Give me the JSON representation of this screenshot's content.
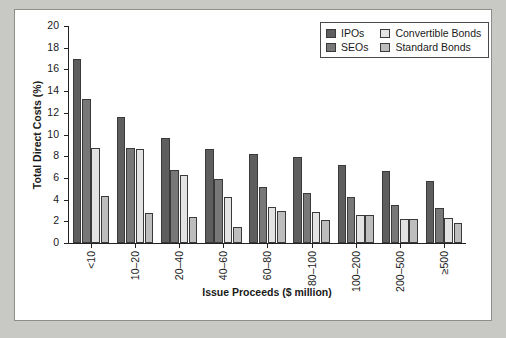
{
  "chart_data": {
    "type": "bar",
    "title": "",
    "xlabel": "Issue Proceeds ($ million)",
    "ylabel": "Total Direct Costs (%)",
    "ylim": [
      0,
      20
    ],
    "yticks": [
      0,
      2,
      4,
      6,
      8,
      10,
      12,
      14,
      16,
      18,
      20
    ],
    "grid": false,
    "legend_position": "top-right",
    "categories": [
      "<10",
      "10–20",
      "20–40",
      "40–60",
      "60–80",
      "80–100",
      "100–200",
      "200–500",
      "≥500"
    ],
    "series": [
      {
        "name": "IPOs",
        "color": "#5e5e5e",
        "values": [
          16.96,
          11.6,
          9.7,
          8.7,
          8.2,
          7.95,
          7.15,
          6.6,
          5.75
        ]
      },
      {
        "name": "SEOs",
        "color": "#787878",
        "values": [
          13.28,
          8.72,
          6.7,
          5.9,
          5.15,
          4.65,
          4.25,
          3.5,
          3.2
        ]
      },
      {
        "name": "Convertible Bonds",
        "color": "#e3e3e3",
        "values": [
          8.75,
          8.65,
          6.3,
          4.25,
          3.35,
          2.85,
          2.6,
          2.25,
          2.35
        ]
      },
      {
        "name": "Standard Bonds",
        "color": "#bdbdbd",
        "values": [
          4.35,
          2.75,
          2.4,
          1.45,
          2.95,
          2.15,
          2.6,
          2.25,
          1.8
        ]
      }
    ]
  },
  "legend": {
    "items": [
      {
        "label": "IPOs"
      },
      {
        "label": "Convertible Bonds"
      },
      {
        "label": "SEOs"
      },
      {
        "label": "Standard Bonds"
      }
    ]
  }
}
